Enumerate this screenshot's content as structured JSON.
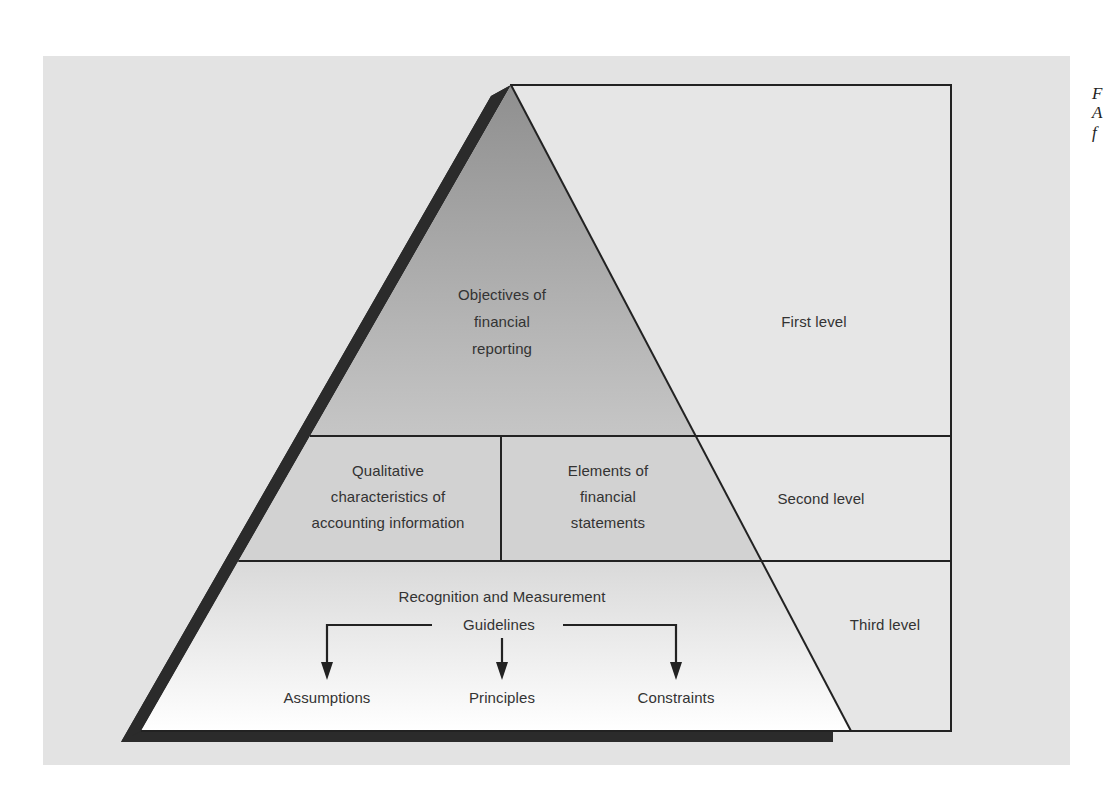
{
  "diagram": {
    "type": "pyramid",
    "levels": [
      {
        "name": "First level",
        "label": "First level",
        "content": [
          "Objectives of",
          "financial",
          "reporting"
        ]
      },
      {
        "name": "Second level",
        "label": "Second level",
        "content_left": [
          "Qualitative",
          "characteristics of",
          "accounting information"
        ],
        "content_right": [
          "Elements of",
          "financial",
          "statements"
        ]
      },
      {
        "name": "Third level",
        "label": "Third level",
        "heading": [
          "Recognition and Measurement",
          "Guidelines"
        ],
        "children": [
          "Assumptions",
          "Principles",
          "Constraints"
        ]
      }
    ],
    "colors": {
      "panel_bg": "#e3e3e3",
      "top_fill_start": "#8f8f8f",
      "top_fill_end": "#c6c6c6",
      "middle_fill": "#d2d2d2",
      "bottom_fill_start": "#d9d9d9",
      "bottom_fill_end": "#ffffff",
      "shadow": "#2b2b2b",
      "line": "#222222",
      "text": "#333333"
    }
  },
  "edge_text": [
    "F",
    "A",
    "f"
  ]
}
